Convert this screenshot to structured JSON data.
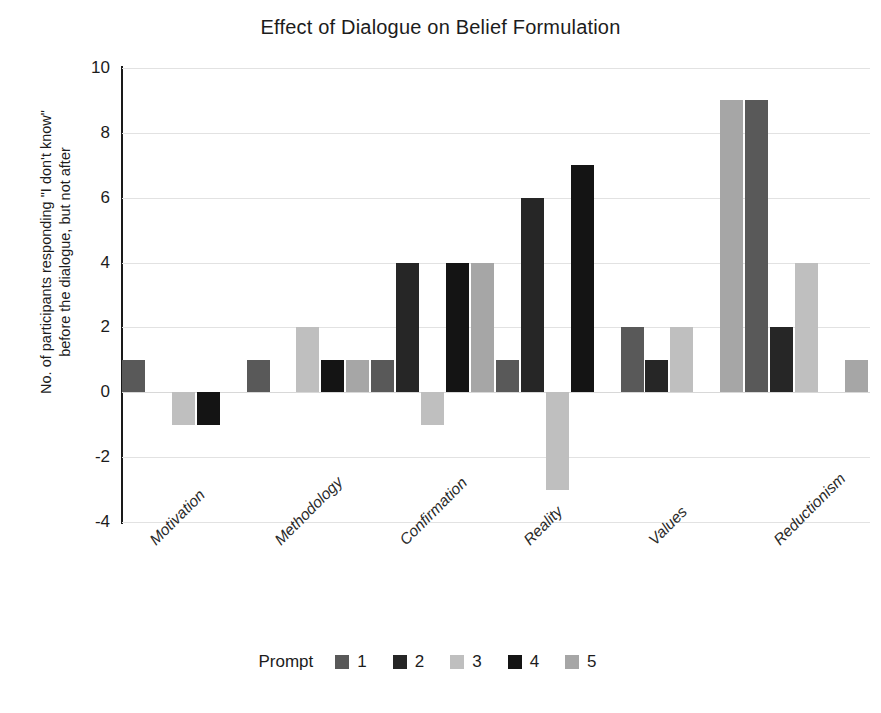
{
  "chart_data": {
    "type": "bar",
    "title": "Effect of Dialogue on Belief Formulation",
    "xlabel": "",
    "ylabel": "No. of participants responding \"I don't know\"\nbefore the dialogue, but not after",
    "ylim": [
      -4,
      10
    ],
    "ytick_values": [
      10,
      8,
      6,
      4,
      2,
      0,
      -2,
      -4
    ],
    "ytick_labels": [
      "10",
      "8",
      "6",
      "4",
      "2",
      "0",
      "-2",
      "-4"
    ],
    "grid": true,
    "legend_position": "bottom",
    "legend_title": "Prompt",
    "categories": [
      "Motivation",
      "Methodology",
      "Confirmation",
      "Reality",
      "Values",
      "Reductionism"
    ],
    "series": [
      {
        "name": "1",
        "color": "#595959",
        "values": [
          1,
          1,
          1,
          1,
          2,
          9
        ]
      },
      {
        "name": "2",
        "color": "#262626",
        "values": [
          0,
          0,
          4,
          6,
          1,
          2
        ]
      },
      {
        "name": "3",
        "color": "#bfbfbf",
        "values": [
          -1,
          2,
          -1,
          -3,
          2,
          4
        ]
      },
      {
        "name": "4",
        "color": "#141414",
        "values": [
          -1,
          1,
          4,
          7,
          0,
          0
        ]
      },
      {
        "name": "5",
        "color": "#a6a6a6",
        "values": [
          0,
          1,
          4,
          0,
          9,
          1
        ]
      }
    ]
  },
  "colors": {
    "axis": "#1a1a1a",
    "grid": "#e2e2e2",
    "text": "#1c1c1c",
    "background": "#ffffff"
  }
}
